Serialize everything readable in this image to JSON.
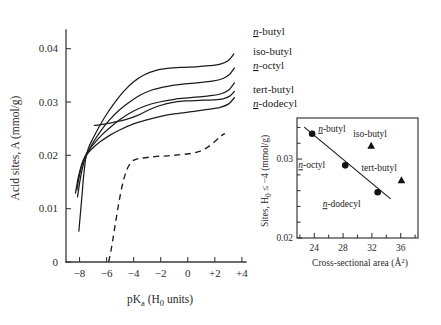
{
  "figure": {
    "background_color": "#ffffff",
    "ink_color": "#1c1c1c",
    "axis_color": "#3a3a3a"
  },
  "chart_data": [
    {
      "id": "main-plot",
      "type": "line",
      "title": "",
      "xlabel": "pKₐ (H₀ units)",
      "ylabel": "Acid sites, A (mmol/g)",
      "xlim": [
        -9.0,
        4.6
      ],
      "ylim": [
        0,
        0.0435
      ],
      "xticks": [
        -8,
        -6,
        -4,
        -2,
        0,
        2,
        4
      ],
      "xticklabels": [
        "−8",
        "−6",
        "−4",
        "−2",
        "0",
        "+2",
        "+4"
      ],
      "yticks": [
        0,
        0.01,
        0.02,
        0.03,
        0.04
      ],
      "yticklabels": [
        "0",
        "0.01",
        "0.02",
        "0.03",
        "0.04"
      ],
      "grid": false,
      "legend_position": "right-inline-labels",
      "series": [
        {
          "name": "n-butyl",
          "name_prefix_italic_underline": "n",
          "name_rest": "-butyl",
          "style": "solid",
          "label_x": 3.2,
          "label_y": 0.04,
          "points": [
            [
              -8.05,
              0.0058
            ],
            [
              -7.85,
              0.0115
            ],
            [
              -7.7,
              0.016
            ],
            [
              -7.55,
              0.0193
            ],
            [
              -7.35,
              0.0213
            ],
            [
              -7.0,
              0.0232
            ],
            [
              -6.5,
              0.0256
            ],
            [
              -6.0,
              0.0277
            ],
            [
              -5.4,
              0.0299
            ],
            [
              -4.7,
              0.0321
            ],
            [
              -4.0,
              0.0338
            ],
            [
              -3.2,
              0.0351
            ],
            [
              -2.4,
              0.0359
            ],
            [
              -1.5,
              0.0363
            ],
            [
              -0.5,
              0.0365
            ],
            [
              0.6,
              0.0366
            ],
            [
              1.6,
              0.0368
            ],
            [
              2.4,
              0.0371
            ],
            [
              3.0,
              0.0378
            ],
            [
              3.4,
              0.039
            ]
          ]
        },
        {
          "name": "iso-butyl",
          "name_prefix_italic_underline": "",
          "name_rest": "iso-butyl",
          "style": "solid",
          "label_x": 3.2,
          "label_y": 0.0367,
          "points": [
            [
              -8.15,
              0.0122
            ],
            [
              -7.95,
              0.0155
            ],
            [
              -7.75,
              0.018
            ],
            [
              -7.55,
              0.0196
            ],
            [
              -7.3,
              0.021
            ],
            [
              -6.95,
              0.0226
            ],
            [
              -6.4,
              0.0247
            ],
            [
              -5.8,
              0.0266
            ],
            [
              -5.1,
              0.0284
            ],
            [
              -4.3,
              0.03
            ],
            [
              -3.5,
              0.0313
            ],
            [
              -2.6,
              0.0323
            ],
            [
              -1.6,
              0.0329
            ],
            [
              -0.5,
              0.0333
            ],
            [
              0.7,
              0.0336
            ],
            [
              1.8,
              0.0339
            ],
            [
              2.6,
              0.0344
            ],
            [
              3.1,
              0.0352
            ],
            [
              3.45,
              0.0364
            ]
          ]
        },
        {
          "name": "n-octyl",
          "name_prefix_italic_underline": "n",
          "name_rest": "-octyl",
          "style": "solid",
          "label_x": 3.2,
          "label_y": 0.034,
          "points": [
            [
              -8.2,
              0.0135
            ],
            [
              -8.0,
              0.0163
            ],
            [
              -7.8,
              0.0184
            ],
            [
              -7.6,
              0.0198
            ],
            [
              -7.35,
              0.0209
            ],
            [
              -7.0,
              0.022
            ],
            [
              -6.4,
              0.0237
            ],
            [
              -5.7,
              0.0253
            ],
            [
              -4.9,
              0.0269
            ],
            [
              -4.0,
              0.0283
            ],
            [
              -3.1,
              0.0293
            ],
            [
              -2.1,
              0.03
            ],
            [
              -1.0,
              0.0305
            ],
            [
              0.2,
              0.0308
            ],
            [
              1.4,
              0.0311
            ],
            [
              2.4,
              0.0315
            ],
            [
              3.0,
              0.0322
            ],
            [
              3.45,
              0.0336
            ]
          ]
        },
        {
          "name": "tert-butyl",
          "name_prefix_italic_underline": "",
          "name_rest": "tert-butyl",
          "style": "solid",
          "label_x": 3.2,
          "label_y": 0.031,
          "points": [
            [
              -6.9,
              0.0256
            ],
            [
              -6.3,
              0.0258
            ],
            [
              -5.5,
              0.0262
            ],
            [
              -4.6,
              0.0267
            ],
            [
              -3.7,
              0.0275
            ],
            [
              -2.9,
              0.0285
            ],
            [
              -2.1,
              0.0293
            ],
            [
              -1.2,
              0.0299
            ],
            [
              -0.2,
              0.0302
            ],
            [
              0.9,
              0.0303
            ],
            [
              1.9,
              0.0304
            ],
            [
              2.6,
              0.0306
            ],
            [
              3.1,
              0.0311
            ],
            [
              3.45,
              0.032
            ]
          ]
        },
        {
          "name": "n-dodecyl",
          "name_prefix_italic_underline": "n",
          "name_rest": "-dodecyl",
          "style": "solid",
          "label_x": 3.2,
          "label_y": 0.0288,
          "points": [
            [
              -8.3,
              0.0129
            ],
            [
              -8.1,
              0.0158
            ],
            [
              -7.9,
              0.0178
            ],
            [
              -7.7,
              0.0192
            ],
            [
              -7.45,
              0.0202
            ],
            [
              -7.1,
              0.0212
            ],
            [
              -6.5,
              0.0225
            ],
            [
              -5.8,
              0.0237
            ],
            [
              -5.0,
              0.0248
            ],
            [
              -4.1,
              0.0258
            ],
            [
              -3.1,
              0.0266
            ],
            [
              -2.0,
              0.0273
            ],
            [
              -0.9,
              0.0278
            ],
            [
              0.3,
              0.0282
            ],
            [
              1.5,
              0.0286
            ],
            [
              2.4,
              0.029
            ],
            [
              3.0,
              0.0296
            ],
            [
              3.45,
              0.0308
            ]
          ]
        },
        {
          "name": "blank-dashed",
          "style": "dashed",
          "points": [
            [
              -5.85,
              0.0
            ],
            [
              -5.7,
              0.0018
            ],
            [
              -5.55,
              0.004
            ],
            [
              -5.35,
              0.0072
            ],
            [
              -5.1,
              0.011
            ],
            [
              -4.85,
              0.0143
            ],
            [
              -4.6,
              0.0166
            ],
            [
              -4.35,
              0.0181
            ],
            [
              -4.05,
              0.019
            ],
            [
              -3.6,
              0.0194
            ],
            [
              -3.0,
              0.0196
            ],
            [
              -2.3,
              0.0198
            ],
            [
              -1.5,
              0.0199
            ],
            [
              -0.7,
              0.0201
            ],
            [
              0.1,
              0.0203
            ],
            [
              0.8,
              0.0207
            ],
            [
              1.4,
              0.0214
            ],
            [
              2.0,
              0.0226
            ],
            [
              2.45,
              0.0236
            ],
            [
              2.75,
              0.0241
            ]
          ]
        }
      ]
    },
    {
      "id": "inset-plot",
      "type": "scatter",
      "title": "",
      "xlabel": "Cross-sectional area (Å²)",
      "ylabel": "Sites, H₀ ≤ −4 (mmol/g)",
      "xlim": [
        21.6,
        38.4
      ],
      "ylim": [
        0.02,
        0.0352
      ],
      "xticks": [
        24,
        28,
        32,
        36
      ],
      "xticklabels": [
        "24",
        "28",
        "32",
        "36"
      ],
      "xminorticks": [
        22,
        26,
        30,
        34,
        38
      ],
      "yticks": [
        0.02,
        0.03
      ],
      "yticklabels": [
        "0.02",
        "0.03"
      ],
      "yminorticks": [
        0.022,
        0.024,
        0.026,
        0.028,
        0.032,
        0.034
      ],
      "grid": false,
      "fit_line": {
        "name": "linear-fit",
        "x_start": 22.6,
        "y_start": 0.03405,
        "x_end": 34.6,
        "y_end": 0.02495
      },
      "points": [
        {
          "name": "n-butyl",
          "name_prefix_italic_underline": "n",
          "name_rest": "-butyl",
          "marker": "circle",
          "x": 23.7,
          "y": 0.0332,
          "label_dx": 6,
          "label_dy": -2
        },
        {
          "name": "n-octyl",
          "name_prefix_italic_underline": "n",
          "name_rest": "-octyl",
          "marker": "circle",
          "x": 28.3,
          "y": 0.0292,
          "label_dx": -47,
          "label_dy": 3
        },
        {
          "name": "n-dodecyl",
          "name_prefix_italic_underline": "n",
          "name_rest": "-dodecyl",
          "marker": "circle",
          "x": 32.8,
          "y": 0.0258,
          "label_dx": -55,
          "label_dy": 15
        },
        {
          "name": "iso-butyl",
          "name_prefix_italic_underline": "",
          "name_rest": "iso-butyl",
          "marker": "triangle",
          "x": 31.9,
          "y": 0.0317,
          "label_dx": -18,
          "label_dy": -9
        },
        {
          "name": "tert-butyl",
          "name_prefix_italic_underline": "",
          "name_rest": "tert-butyl",
          "marker": "triangle",
          "x": 36.1,
          "y": 0.0273,
          "label_dx": -40,
          "label_dy": -9
        }
      ]
    }
  ],
  "main_axis_labels": {
    "y_title": "Acid sites, A (mmol/g)",
    "x_title_pre": "pK",
    "x_title_sub": "a",
    "x_title_post": " (H",
    "x_title_sub2": "0",
    "x_title_end": " units)",
    "yticks": [
      "0.04",
      "0.03",
      "0.02",
      "0.01",
      "0"
    ],
    "xticks": [
      "−8",
      "−6",
      "−4",
      "−2",
      "0",
      "+2",
      "+4"
    ]
  },
  "inset_axis_labels": {
    "y_title_pre": "Sites, H",
    "y_title_sub": "0",
    "y_title_post": " ≤ −4 (mmol/g)",
    "x_title_pre": "Cross-sectional area (Å",
    "x_title_sup": "2",
    "x_title_post": ")",
    "yticks": [
      "0.03",
      "0.02"
    ],
    "xticks": [
      "24",
      "28",
      "32",
      "36"
    ]
  },
  "series_labels": {
    "n_butyl_prefix": "n",
    "n_butyl_rest": "-butyl",
    "iso_butyl": "iso-butyl",
    "n_octyl_prefix": "n",
    "n_octyl_rest": "-octyl",
    "tert_butyl": "tert-butyl",
    "n_dodecyl_prefix": "n",
    "n_dodecyl_rest": "-dodecyl"
  },
  "inset_point_labels": {
    "n_butyl_prefix": "n",
    "n_butyl_rest": "-butyl",
    "iso_butyl": "iso-butyl",
    "n_octyl_prefix": "n",
    "n_octyl_rest": "-octyl",
    "tert_butyl": "tert-butyl",
    "n_dodecyl_prefix": "n",
    "n_dodecyl_rest": "-dodecyl"
  }
}
